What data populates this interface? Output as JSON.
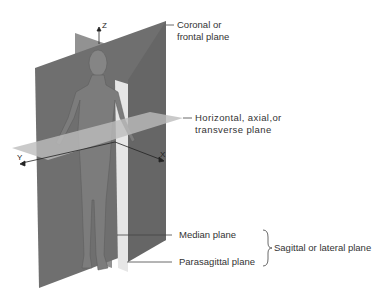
{
  "figure": {
    "axes": {
      "z": "Z",
      "x": "X",
      "y": "Y"
    },
    "labels": {
      "coronal_line1": "Coronal or",
      "coronal_line2": "frontal plane",
      "horizontal_line1": "Horizontal, axial,or",
      "horizontal_line2": "transverse plane",
      "median": "Median plane",
      "parasagittal": "Parasagittal plane",
      "sagittal_group": "Sagittal or lateral plane"
    },
    "colors": {
      "coronal_plane": "#6e6e6e",
      "median_plane": "#8a8a8a",
      "parasagittal_plane": "#e4e4e4",
      "horizontal_plane": "#b0b0b0",
      "body": "#7a7a7a",
      "text": "#333333",
      "leader_line": "#444444"
    }
  }
}
